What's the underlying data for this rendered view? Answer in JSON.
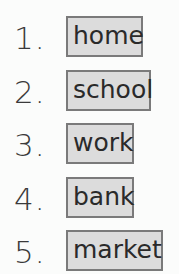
{
  "items": [
    {
      "number": "1.",
      "word": "home"
    },
    {
      "number": "2.",
      "word": "school"
    },
    {
      "number": "3.",
      "word": "work"
    },
    {
      "number": "4.",
      "word": "bank"
    },
    {
      "number": "5.",
      "word": "market"
    }
  ]
}
